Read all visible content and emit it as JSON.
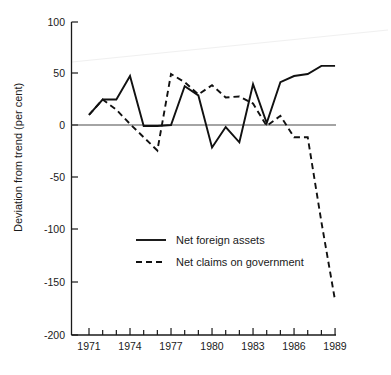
{
  "chart_data": {
    "type": "line",
    "title": "",
    "subtitle": "",
    "xlabel": "",
    "ylabel": "Deviation from trend (per cent)",
    "xlim": [
      1970.6,
      1989.4
    ],
    "ylim": [
      -200,
      100
    ],
    "grid": false,
    "legend_position": "center",
    "x_tick_labels": [
      "1971",
      "1974",
      "1977",
      "1980",
      "1983",
      "1986",
      "1989"
    ],
    "x_tick_values": [
      1971,
      1974,
      1977,
      1980,
      1983,
      1986,
      1989
    ],
    "x_minor_ticks": [
      1972,
      1973,
      1975,
      1976,
      1978,
      1979,
      1981,
      1982,
      1984,
      1985,
      1987,
      1988
    ],
    "y_tick_labels": [
      "100",
      "50",
      "0",
      "-50",
      "-100",
      "-150",
      "-200"
    ],
    "y_tick_values": [
      100,
      50,
      0,
      -50,
      -100,
      -150,
      -200
    ],
    "x": [
      1971,
      1972,
      1973,
      1974,
      1975,
      1976,
      1977,
      1978,
      1979,
      1980,
      1981,
      1982,
      1983,
      1984,
      1985,
      1986,
      1987,
      1988,
      1989
    ],
    "series": [
      {
        "name": "Net foreign assets",
        "style": "solid",
        "color": "#111111",
        "values": [
          10,
          25,
          25,
          48,
          -1,
          -1,
          0,
          38,
          29,
          -22,
          -2,
          -17,
          40,
          2,
          42,
          48,
          50,
          58,
          58
        ]
      },
      {
        "name": "Net claims on government",
        "style": "dashed",
        "color": "#111111",
        "values": [
          10,
          25,
          15,
          1,
          -12,
          -25,
          50,
          42,
          30,
          39,
          27,
          28,
          21,
          -1,
          9,
          -12,
          -12,
          -95,
          -172
        ]
      }
    ]
  },
  "legend": {
    "items": [
      {
        "label": "Net foreign assets",
        "style": "solid"
      },
      {
        "label": "Net claims on government",
        "style": "dashed"
      }
    ]
  },
  "axis": {
    "y_label": "Deviation from trend (per cent)"
  }
}
